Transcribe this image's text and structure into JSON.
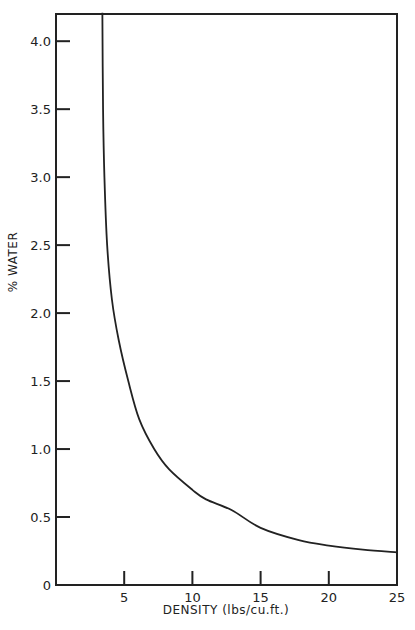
{
  "chart_data": {
    "type": "line",
    "title": "",
    "xlabel": "DENSITY (lbs/cu.ft.)",
    "ylabel": "% WATER",
    "xlim": [
      0,
      25
    ],
    "ylim": [
      0,
      4.2
    ],
    "xticks": [
      5,
      10,
      15,
      20,
      25
    ],
    "xtick_labels": [
      "5",
      "10",
      "15",
      "20",
      "25"
    ],
    "yticks": [
      0,
      0.5,
      1.0,
      1.5,
      2.0,
      2.5,
      3.0,
      3.5,
      4.0
    ],
    "ytick_labels": [
      "0",
      "0.5",
      "1.0",
      "1.5",
      "2.0",
      "2.5",
      "3.0",
      "3.5",
      "4.0"
    ],
    "grid": false,
    "legend": null,
    "series": [
      {
        "name": "% Water vs Density",
        "x": [
          3.4,
          3.45,
          3.55,
          3.75,
          4.1,
          4.6,
          5.3,
          6.1,
          7.2,
          8.3,
          10.0,
          11.0,
          12.9,
          15.0,
          17.8,
          20.0,
          22.5,
          25.0
        ],
        "y": [
          4.21,
          3.5,
          3.0,
          2.5,
          2.1,
          1.8,
          1.5,
          1.22,
          1.0,
          0.85,
          0.7,
          0.63,
          0.55,
          0.42,
          0.33,
          0.29,
          0.26,
          0.24
        ]
      }
    ]
  },
  "axes": {
    "x_title": "DENSITY (lbs/cu.ft.)",
    "y_title": "% WATER"
  }
}
